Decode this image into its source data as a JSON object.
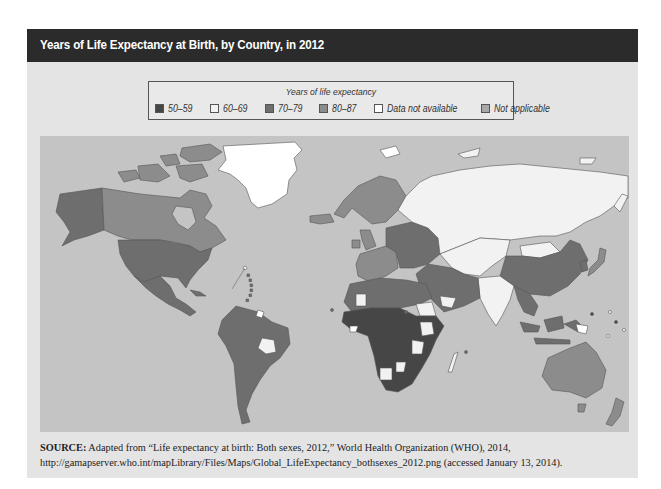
{
  "title": "Years of Life Expectancy at Birth, by Country, in 2012",
  "legend": {
    "title": "Years of life expectancy",
    "items": [
      {
        "label": "50–59",
        "color": "#464646"
      },
      {
        "label": "60–69",
        "color": "#f2f2f2"
      },
      {
        "label": "70–79",
        "color": "#6e6e6e"
      },
      {
        "label": "80–87",
        "color": "#8c8c8c"
      },
      {
        "label": "Data not available",
        "color": "#ffffff"
      },
      {
        "label": "Not applicable",
        "color": "#a8a8a8"
      }
    ]
  },
  "map": {
    "ocean_color": "#c4c4c4",
    "regions": [
      {
        "name": "Greenland",
        "category": "Data not available"
      },
      {
        "name": "Canada",
        "category": "80–87"
      },
      {
        "name": "Alaska / United States",
        "category": "70–79"
      },
      {
        "name": "Mexico & Central America",
        "category": "70–79"
      },
      {
        "name": "South America",
        "category": "70–79"
      },
      {
        "name": "Bolivia",
        "category": "60–69"
      },
      {
        "name": "Western Europe",
        "category": "80–87"
      },
      {
        "name": "Eastern Europe",
        "category": "70–79"
      },
      {
        "name": "Russia",
        "category": "60–69"
      },
      {
        "name": "Central Asia",
        "category": "60–69"
      },
      {
        "name": "China",
        "category": "70–79"
      },
      {
        "name": "India",
        "category": "60–69"
      },
      {
        "name": "Japan",
        "category": "80–87"
      },
      {
        "name": "Middle East",
        "category": "70–79"
      },
      {
        "name": "North Africa",
        "category": "70–79"
      },
      {
        "name": "Sub-Saharan Africa",
        "category": "50–59"
      },
      {
        "name": "Southeast Asia",
        "category": "70–79"
      },
      {
        "name": "Australia",
        "category": "80–87"
      },
      {
        "name": "New Zealand",
        "category": "80–87"
      }
    ]
  },
  "source": {
    "label": "SOURCE:",
    "text": "Adapted from “Life expectancy at birth: Both sexes, 2012,” World Health Organization (WHO), 2014, http://gamapserver.who.int/mapLibrary/Files/Maps/Global_LifeExpectancy_bothsexes_2012.png (accessed January 13, 2014)."
  }
}
